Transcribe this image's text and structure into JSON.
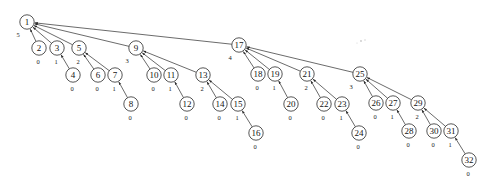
{
  "diagram": {
    "type": "binomial-tree",
    "title": "",
    "node_radius": 7.2,
    "edge_direction": "child-to-parent",
    "degree_label_note": "number shown below-left of each node is its degree",
    "nodes": [
      {
        "id": "1",
        "x": 27,
        "y": 22,
        "degree": "5",
        "deg_dx": -9,
        "deg_dy": 12
      },
      {
        "id": "2",
        "x": 39,
        "y": 48,
        "degree": "0",
        "deg_dx": -1,
        "deg_dy": 13
      },
      {
        "id": "3",
        "x": 57,
        "y": 48,
        "degree": "1",
        "deg_dx": -1,
        "deg_dy": 13
      },
      {
        "id": "4",
        "x": 73,
        "y": 75,
        "degree": "0",
        "deg_dx": -1,
        "deg_dy": 13
      },
      {
        "id": "5",
        "x": 79,
        "y": 48,
        "degree": "2",
        "deg_dx": -1,
        "deg_dy": 13
      },
      {
        "id": "6",
        "x": 98,
        "y": 75,
        "degree": "0",
        "deg_dx": -1,
        "deg_dy": 13
      },
      {
        "id": "7",
        "x": 115,
        "y": 75,
        "degree": "1",
        "deg_dx": -1,
        "deg_dy": 13
      },
      {
        "id": "8",
        "x": 131,
        "y": 104,
        "degree": "0",
        "deg_dx": -1,
        "deg_dy": 13
      },
      {
        "id": "9",
        "x": 136,
        "y": 48,
        "degree": "3",
        "deg_dx": -9,
        "deg_dy": 12
      },
      {
        "id": "10",
        "x": 154,
        "y": 75,
        "degree": "0",
        "deg_dx": -1,
        "deg_dy": 13
      },
      {
        "id": "11",
        "x": 171,
        "y": 75,
        "degree": "1",
        "deg_dx": -1,
        "deg_dy": 13
      },
      {
        "id": "12",
        "x": 187,
        "y": 104,
        "degree": "0",
        "deg_dx": -1,
        "deg_dy": 13
      },
      {
        "id": "13",
        "x": 203,
        "y": 75,
        "degree": "2",
        "deg_dx": -1,
        "deg_dy": 13
      },
      {
        "id": "14",
        "x": 220,
        "y": 104,
        "degree": "0",
        "deg_dx": -1,
        "deg_dy": 13
      },
      {
        "id": "15",
        "x": 238,
        "y": 104,
        "degree": "1",
        "deg_dx": -1,
        "deg_dy": 13
      },
      {
        "id": "16",
        "x": 256,
        "y": 133,
        "degree": "0",
        "deg_dx": -1,
        "deg_dy": 13
      },
      {
        "id": "17",
        "x": 239,
        "y": 45,
        "degree": "4",
        "deg_dx": -9,
        "deg_dy": 12
      },
      {
        "id": "18",
        "x": 258,
        "y": 74,
        "degree": "0",
        "deg_dx": -1,
        "deg_dy": 13
      },
      {
        "id": "19",
        "x": 275,
        "y": 74,
        "degree": "1",
        "deg_dx": -1,
        "deg_dy": 13
      },
      {
        "id": "20",
        "x": 291,
        "y": 104,
        "degree": "0",
        "deg_dx": -1,
        "deg_dy": 13
      },
      {
        "id": "21",
        "x": 307,
        "y": 74,
        "degree": "2",
        "deg_dx": -1,
        "deg_dy": 13
      },
      {
        "id": "22",
        "x": 324,
        "y": 104,
        "degree": "0",
        "deg_dx": -1,
        "deg_dy": 13
      },
      {
        "id": "23",
        "x": 342,
        "y": 104,
        "degree": "1",
        "deg_dx": -1,
        "deg_dy": 13
      },
      {
        "id": "24",
        "x": 359,
        "y": 133,
        "degree": "0",
        "deg_dx": -1,
        "deg_dy": 13
      },
      {
        "id": "25",
        "x": 360,
        "y": 74,
        "degree": "3",
        "deg_dx": -9,
        "deg_dy": 12
      },
      {
        "id": "26",
        "x": 376,
        "y": 103,
        "degree": "0",
        "deg_dx": -1,
        "deg_dy": 13
      },
      {
        "id": "27",
        "x": 393,
        "y": 103,
        "degree": "1",
        "deg_dx": -1,
        "deg_dy": 13
      },
      {
        "id": "28",
        "x": 409,
        "y": 131,
        "degree": "0",
        "deg_dx": -1,
        "deg_dy": 13
      },
      {
        "id": "29",
        "x": 418,
        "y": 103,
        "degree": "2",
        "deg_dx": -1,
        "deg_dy": 13
      },
      {
        "id": "30",
        "x": 434,
        "y": 131,
        "degree": "0",
        "deg_dx": -1,
        "deg_dy": 13
      },
      {
        "id": "31",
        "x": 451,
        "y": 131,
        "degree": "1",
        "deg_dx": -1,
        "deg_dy": 13
      },
      {
        "id": "32",
        "x": 469,
        "y": 160,
        "degree": "0",
        "deg_dx": -1,
        "deg_dy": 13
      }
    ],
    "edges": [
      {
        "from": "2",
        "to": "1"
      },
      {
        "from": "3",
        "to": "1"
      },
      {
        "from": "5",
        "to": "1"
      },
      {
        "from": "9",
        "to": "1"
      },
      {
        "from": "17",
        "to": "1"
      },
      {
        "from": "4",
        "to": "3"
      },
      {
        "from": "6",
        "to": "5"
      },
      {
        "from": "7",
        "to": "5"
      },
      {
        "from": "8",
        "to": "7"
      },
      {
        "from": "10",
        "to": "9"
      },
      {
        "from": "11",
        "to": "9"
      },
      {
        "from": "13",
        "to": "9"
      },
      {
        "from": "12",
        "to": "11"
      },
      {
        "from": "14",
        "to": "13"
      },
      {
        "from": "15",
        "to": "13"
      },
      {
        "from": "16",
        "to": "15"
      },
      {
        "from": "18",
        "to": "17"
      },
      {
        "from": "19",
        "to": "17"
      },
      {
        "from": "21",
        "to": "17"
      },
      {
        "from": "25",
        "to": "17"
      },
      {
        "from": "20",
        "to": "19"
      },
      {
        "from": "22",
        "to": "21"
      },
      {
        "from": "23",
        "to": "21"
      },
      {
        "from": "24",
        "to": "23"
      },
      {
        "from": "26",
        "to": "25"
      },
      {
        "from": "27",
        "to": "25"
      },
      {
        "from": "29",
        "to": "25"
      },
      {
        "from": "28",
        "to": "27"
      },
      {
        "from": "30",
        "to": "29"
      },
      {
        "from": "31",
        "to": "29"
      },
      {
        "from": "32",
        "to": "31"
      }
    ],
    "specks": [
      {
        "x": 361,
        "y": 41,
        "r": 0.9
      },
      {
        "x": 365,
        "y": 40,
        "r": 0.7
      },
      {
        "x": 357,
        "y": 43,
        "r": 0.5
      }
    ],
    "colors": {
      "stroke": "#2b2b2b",
      "node_fill": "#ffffff",
      "text": "#141414",
      "background": "#ffffff"
    }
  }
}
